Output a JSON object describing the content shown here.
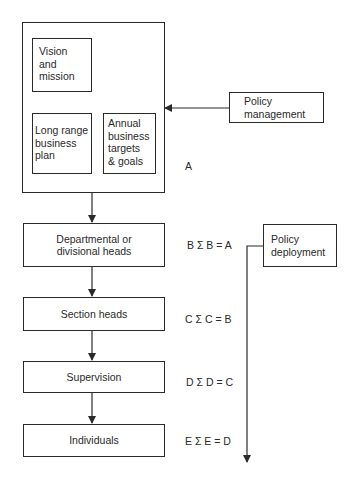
{
  "diagram": {
    "outer_group": {
      "label": "A",
      "boxes": {
        "vision": {
          "label": "Vision\nand\nmission",
          "lines": [
            "Vision",
            "and",
            "mission"
          ]
        },
        "long_range": {
          "lines": [
            "Long range",
            "business",
            "plan"
          ]
        },
        "annual": {
          "lines": [
            "Annual",
            "business",
            "targets",
            "& goals"
          ]
        }
      }
    },
    "policy_management": {
      "lines": [
        "Policy",
        "management"
      ]
    },
    "policy_deployment": {
      "lines": [
        "Policy",
        "deployment"
      ]
    },
    "hierarchy": [
      {
        "lines": [
          "Departmental or",
          "divisional heads"
        ],
        "equation": "B Σ B = A"
      },
      {
        "lines": [
          "Section heads"
        ],
        "equation": "C Σ C = B"
      },
      {
        "lines": [
          "Supervision"
        ],
        "equation": "D Σ D = C"
      },
      {
        "lines": [
          "Individuals"
        ],
        "equation": "E Σ E = D"
      }
    ]
  },
  "colors": {
    "line": "#2a2a2a",
    "background": "#ffffff"
  }
}
